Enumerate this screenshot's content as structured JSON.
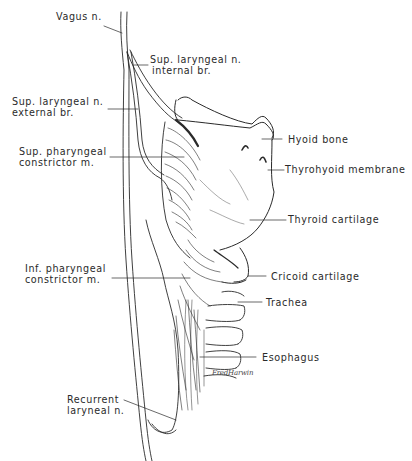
{
  "figure": {
    "ink_color": "#2a2a2a",
    "background": "#ffffff"
  },
  "labels": {
    "vagus": "Vagus n.",
    "sup_laryngeal_internal_1": "Sup. laryngeal n.",
    "sup_laryngeal_internal_2": "internal br.",
    "sup_laryngeal_external_1": "Sup. laryngeal n.",
    "sup_laryngeal_external_2": "external br.",
    "sup_pharyngeal_1": "Sup. pharyngeal",
    "sup_pharyngeal_2": "constrictor m.",
    "hyoid": "Hyoid bone",
    "thyrohyoid": "Thyrohyoid membrane",
    "thyroid": "Thyroid cartilage",
    "inf_pharyngeal_1": "Inf. pharyngeal",
    "inf_pharyngeal_2": "constrictor m.",
    "cricoid": "Cricoid cartilage",
    "trachea": "Trachea",
    "esophagus": "Esophagus",
    "recurrent_1": "Recurrent",
    "recurrent_2": "laryneal n."
  },
  "signature": "FredHarwin"
}
